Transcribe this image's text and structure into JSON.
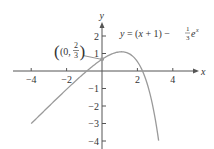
{
  "chart_data": {
    "type": "line",
    "title": "",
    "equation_label": "y = (x + 1) − (1/3)e^x",
    "equation": {
      "lhs": "y = (",
      "x": "x",
      "mid": " + 1) − ",
      "frac_num": "1",
      "frac_den": "3",
      "e": "e",
      "exp": "x"
    },
    "xlabel": "x",
    "ylabel": "y",
    "xlim": [
      -4.5,
      5.2
    ],
    "ylim": [
      -4.3,
      2.8
    ],
    "x_ticks": [
      -4,
      -2,
      2,
      4
    ],
    "x_tick_labels": [
      "−4",
      "−2",
      "2",
      "4"
    ],
    "y_ticks": [
      2,
      1,
      -1,
      -2,
      -3,
      -4
    ],
    "y_tick_labels": [
      "2",
      "1",
      "−1",
      "−2",
      "−3",
      "−4"
    ],
    "grid": false,
    "series": [
      {
        "name": "y = (x + 1) − (1/3)e^x",
        "x": [
          -4,
          -3,
          -2,
          -1,
          0,
          0.5,
          1,
          1.1,
          1.5,
          2,
          2.5,
          3,
          3.2
        ],
        "values": [
          -3.01,
          -2.02,
          -1.05,
          -0.12,
          0.67,
          0.95,
          1.09,
          1.1,
          1.01,
          0.54,
          -0.56,
          -2.7,
          -3.98
        ]
      }
    ],
    "annotations": [
      {
        "point": [
          0,
          0.667
        ],
        "label": "(0, 2/3)",
        "label_open": "(0,",
        "frac_num": "2",
        "frac_den": "3",
        "label_close": ")"
      }
    ],
    "colors": {
      "curve": "#9a9a9a",
      "axes": "#555555",
      "point": "#9a9a9a"
    }
  }
}
